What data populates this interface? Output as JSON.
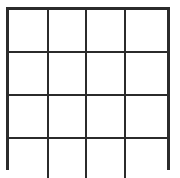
{
  "figure": {
    "name": "empty-4x4-grid",
    "type": "grid",
    "title": "",
    "rows": 4,
    "columns": 4,
    "cell_count": 16,
    "cells": [
      [
        {
          "label": ""
        },
        {
          "label": ""
        },
        {
          "label": ""
        },
        {
          "label": ""
        }
      ],
      [
        {
          "label": ""
        },
        {
          "label": ""
        },
        {
          "label": ""
        },
        {
          "label": ""
        }
      ],
      [
        {
          "label": ""
        },
        {
          "label": ""
        },
        {
          "label": ""
        },
        {
          "label": ""
        }
      ],
      [
        {
          "label": ""
        },
        {
          "label": ""
        },
        {
          "label": ""
        },
        {
          "label": ""
        }
      ]
    ],
    "geometry": {
      "left_px": 6,
      "top_px": 7,
      "width_px": 164,
      "height_px": 163,
      "vertical_line_x_px": [
        6,
        47,
        87,
        127,
        170
      ],
      "horizontal_line_y_px": [
        7,
        48,
        89,
        130,
        170
      ],
      "column_widths_px": [
        41,
        40,
        40,
        43
      ],
      "row_heights_px": [
        41,
        41,
        41,
        40
      ]
    },
    "style": {
      "line_color": "#2b2b2b",
      "line_width_px": 2,
      "outer_line_width_px": 3,
      "cell_fill": "#ffffff",
      "background": "#ffffff"
    }
  },
  "canvas": {
    "width_px": 180,
    "height_px": 178,
    "background": "#ffffff"
  }
}
